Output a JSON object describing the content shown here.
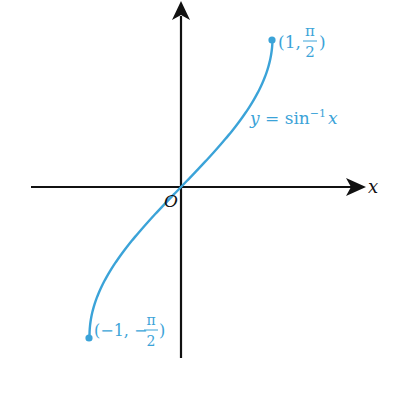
{
  "chart_data": {
    "type": "line",
    "title": "",
    "xlabel": "x",
    "ylabel": "",
    "function": "y = sin^-1 x",
    "domain": [
      -1,
      1
    ],
    "range": [
      "-π/2",
      "π/2"
    ],
    "x": [
      -1,
      -0.75,
      -0.5,
      -0.25,
      0,
      0.25,
      0.5,
      0.75,
      1
    ],
    "y": [
      -1.5708,
      -0.8481,
      -0.5236,
      -0.2527,
      0,
      0.2527,
      0.5236,
      0.8481,
      1.5708
    ],
    "grid": false,
    "legend": "none",
    "annotations": [
      "(1, π/2)",
      "(-1, -π/2)",
      "y = sin⁻¹x",
      "O"
    ]
  },
  "labels": {
    "x_axis": "x",
    "origin": "O",
    "curve": "y = sin",
    "curve_sup": "−1",
    "curve_var": "x",
    "top_point_prefix": "(1, ",
    "top_point_num": "π",
    "top_point_den": "2",
    "top_point_suffix": ")",
    "bottom_point_prefix": "(−1, −",
    "bottom_point_num": "π",
    "bottom_point_den": "2",
    "bottom_point_suffix": ")"
  },
  "colors": {
    "curve": "#3ba3d8",
    "axis": "#111111"
  }
}
